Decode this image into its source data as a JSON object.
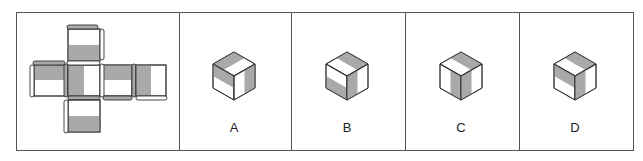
{
  "puzzle": {
    "type": "cube-net-folding",
    "colors": {
      "shade": "#a9a9a9",
      "edge": "#333333",
      "face": "#ffffff",
      "border": "#555555"
    },
    "net": {
      "faces": [
        {
          "id": "top",
          "pattern": "bottom-half-gray"
        },
        {
          "id": "left",
          "pattern": "top-half-gray"
        },
        {
          "id": "center",
          "pattern": "left-half-gray"
        },
        {
          "id": "right",
          "pattern": "top-half-gray"
        },
        {
          "id": "far-right",
          "pattern": "left-half-gray"
        },
        {
          "id": "bottom",
          "pattern": "bottom-half-gray"
        }
      ]
    },
    "options": [
      {
        "label": "A"
      },
      {
        "label": "B"
      },
      {
        "label": "C"
      },
      {
        "label": "D"
      }
    ]
  }
}
